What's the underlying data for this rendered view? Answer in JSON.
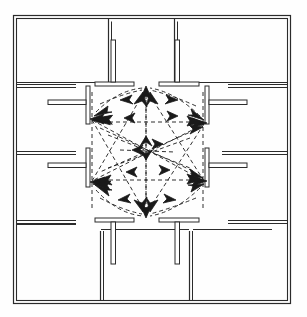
{
  "diagram": {
    "type": "architectural-floor-plan",
    "line_color": "#2b2b2b",
    "flow_color": "#1a1a1a",
    "background_color": "#ffffff",
    "canvas": {
      "width": 307,
      "height": 317
    }
  },
  "building": {
    "outline": {
      "x": 13,
      "y": 15,
      "width": 278,
      "height": 289,
      "wall_thickness": 3.2
    },
    "label": "perimeter-wall"
  },
  "atrium": {
    "label": "central-atrium",
    "x": 88,
    "y": 84,
    "width": 119,
    "height": 134
  },
  "rooms": [
    {
      "name": "room-top-left",
      "x": 16,
      "y": 18,
      "width": 94,
      "height": 64
    },
    {
      "name": "room-top-right",
      "x": 175,
      "y": 18,
      "width": 113,
      "height": 64
    },
    {
      "name": "room-left-upper",
      "x": 16,
      "y": 86,
      "width": 60,
      "height": 64
    },
    {
      "name": "room-left-lower",
      "x": 16,
      "y": 154,
      "width": 60,
      "height": 66
    },
    {
      "name": "room-left-bottom",
      "x": 16,
      "y": 224,
      "width": 60,
      "height": 77
    },
    {
      "name": "room-right-upper",
      "x": 222,
      "y": 86,
      "width": 66,
      "height": 64
    },
    {
      "name": "room-right-lower",
      "x": 222,
      "y": 154,
      "width": 66,
      "height": 66
    },
    {
      "name": "room-right-bottom",
      "x": 222,
      "y": 224,
      "width": 66,
      "height": 77
    },
    {
      "name": "room-bottom-left",
      "x": 101,
      "y": 228,
      "width": 88,
      "height": 73
    },
    {
      "name": "room-bottom-right",
      "x": 193,
      "y": 228,
      "width": 80,
      "height": 73
    }
  ],
  "wall_stubs": [
    {
      "name": "stub-top-left",
      "orientation": "T-down",
      "bar_x1": 96,
      "bar_x2": 133,
      "bar_y": 84,
      "stem_x": 113,
      "stem_y1": 84,
      "stem_y2": 40
    },
    {
      "name": "stub-top-right",
      "orientation": "T-down",
      "bar_x1": 160,
      "bar_x2": 198,
      "bar_y": 84,
      "stem_x": 178,
      "stem_y1": 84,
      "stem_y2": 40
    },
    {
      "name": "stub-bottom-left",
      "orientation": "T-up",
      "bar_x1": 96,
      "bar_x2": 133,
      "bar_y": 220,
      "stem_x": 113,
      "stem_y1": 220,
      "stem_y2": 262
    },
    {
      "name": "stub-bottom-right",
      "orientation": "T-up",
      "bar_x1": 160,
      "bar_x2": 198,
      "bar_y": 220,
      "stem_x": 178,
      "stem_y1": 220,
      "stem_y2": 262
    },
    {
      "name": "stub-left-upper",
      "orientation": "T-right",
      "bar_y1": 86,
      "bar_y2": 122,
      "bar_x": 88,
      "stem_y": 104,
      "stem_x1": 88,
      "stem_x2": 48
    },
    {
      "name": "stub-left-lower",
      "orientation": "T-right",
      "bar_y1": 148,
      "bar_y2": 186,
      "bar_x": 88,
      "stem_y": 167,
      "stem_x1": 88,
      "stem_x2": 48
    },
    {
      "name": "stub-right-upper",
      "orientation": "T-left",
      "bar_y1": 86,
      "bar_y2": 122,
      "bar_x": 207,
      "stem_y": 104,
      "stem_x1": 207,
      "stem_x2": 246
    },
    {
      "name": "stub-right-lower",
      "orientation": "T-left",
      "bar_y1": 148,
      "bar_y2": 186,
      "bar_x": 207,
      "stem_y": 167,
      "stem_x1": 207,
      "stem_x2": 246
    }
  ],
  "circulation": {
    "label": "circulation-flow-arrows",
    "style": "dashed-with-arrowheads",
    "nodes": [
      {
        "name": "node-top-left",
        "x": 90,
        "y": 119
      },
      {
        "name": "node-top-right",
        "x": 205,
        "y": 124
      },
      {
        "name": "node-bottom-left",
        "x": 90,
        "y": 182
      },
      {
        "name": "node-bottom-right",
        "x": 205,
        "y": 182
      },
      {
        "name": "node-top-gap",
        "x": 146,
        "y": 88
      },
      {
        "name": "node-bottom-gap",
        "x": 146,
        "y": 216
      }
    ],
    "edge_count": 30
  }
}
